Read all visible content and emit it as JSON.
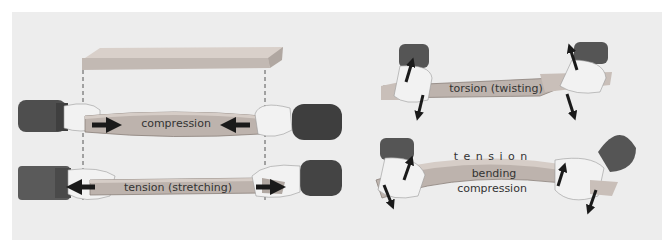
{
  "colors": {
    "panel_bg": "#ededed",
    "bar": "#bdb3ad",
    "bar_top": "#d6cdc7",
    "sleeve": "#5a5a5a",
    "hand": "#f2f2f2",
    "arrow": "#1a1a1a",
    "text": "#333333"
  },
  "figures": {
    "original": {
      "name": "unloaded-beam"
    },
    "compression": {
      "label": "compression"
    },
    "tension": {
      "label": "tension (stretching)"
    },
    "torsion": {
      "label": "torsion (twisting)"
    },
    "bending": {
      "top_label": "t e n s i o n",
      "middle_label": "bending",
      "bottom_label": "compression"
    }
  }
}
